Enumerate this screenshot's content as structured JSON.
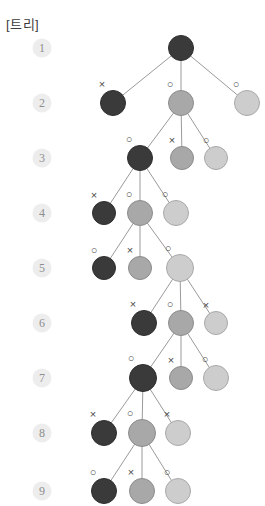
{
  "title": "[트리]",
  "colors": {
    "dark": "#3a3a3a",
    "medium": "#a8a8a8",
    "light": "#cdcdcd",
    "edge": "#9a9a9a",
    "badge_bg": "#ededed",
    "badge_text": "#8e8e8e",
    "mark_text": "#4a4a4a",
    "background": "#ffffff"
  },
  "levels": [
    {
      "label": "1",
      "y": 48,
      "badge_x": 42
    },
    {
      "label": "2",
      "y": 103,
      "badge_x": 42
    },
    {
      "label": "3",
      "y": 158,
      "badge_x": 42
    },
    {
      "label": "4",
      "y": 213,
      "badge_x": 42
    },
    {
      "label": "5",
      "y": 268,
      "badge_x": 42
    },
    {
      "label": "6",
      "y": 323,
      "badge_x": 42
    },
    {
      "label": "7",
      "y": 378,
      "badge_x": 42
    },
    {
      "label": "8",
      "y": 433,
      "badge_x": 42
    },
    {
      "label": "9",
      "y": 491,
      "badge_x": 42
    }
  ],
  "nodes": [
    {
      "id": "n1",
      "level": 1,
      "x": 181,
      "y": 48,
      "r": 13,
      "shade": "dark",
      "mark": "",
      "active": true
    },
    {
      "id": "n2a",
      "level": 2,
      "x": 113,
      "y": 103,
      "r": 13,
      "shade": "dark",
      "mark": "×",
      "active": false
    },
    {
      "id": "n2b",
      "level": 2,
      "x": 181,
      "y": 103,
      "r": 13,
      "shade": "med",
      "mark": "○",
      "active": true
    },
    {
      "id": "n2c",
      "level": 2,
      "x": 247,
      "y": 103,
      "r": 13,
      "shade": "light",
      "mark": "○",
      "active": false
    },
    {
      "id": "n3a",
      "level": 3,
      "x": 140,
      "y": 158,
      "r": 13,
      "shade": "dark",
      "mark": "○",
      "active": true
    },
    {
      "id": "n3b",
      "level": 3,
      "x": 182,
      "y": 158,
      "r": 12,
      "shade": "med",
      "mark": "×",
      "active": false
    },
    {
      "id": "n3c",
      "level": 3,
      "x": 216,
      "y": 158,
      "r": 12,
      "shade": "light",
      "mark": "○",
      "active": false
    },
    {
      "id": "n4a",
      "level": 4,
      "x": 104,
      "y": 213,
      "r": 12,
      "shade": "dark",
      "mark": "×",
      "active": false
    },
    {
      "id": "n4b",
      "level": 4,
      "x": 140,
      "y": 213,
      "r": 13,
      "shade": "med",
      "mark": "○",
      "active": true
    },
    {
      "id": "n4c",
      "level": 4,
      "x": 176,
      "y": 213,
      "r": 13,
      "shade": "light",
      "mark": "○",
      "active": false
    },
    {
      "id": "n5a",
      "level": 5,
      "x": 104,
      "y": 268,
      "r": 12,
      "shade": "dark",
      "mark": "○",
      "active": false
    },
    {
      "id": "n5b",
      "level": 5,
      "x": 140,
      "y": 268,
      "r": 12,
      "shade": "med",
      "mark": "×",
      "active": false
    },
    {
      "id": "n5c",
      "level": 5,
      "x": 180,
      "y": 268,
      "r": 14,
      "shade": "light",
      "mark": "○",
      "active": true
    },
    {
      "id": "n6a",
      "level": 6,
      "x": 144,
      "y": 323,
      "r": 13,
      "shade": "dark",
      "mark": "×",
      "active": false
    },
    {
      "id": "n6b",
      "level": 6,
      "x": 181,
      "y": 323,
      "r": 13,
      "shade": "med",
      "mark": "○",
      "active": true
    },
    {
      "id": "n6c",
      "level": 6,
      "x": 216,
      "y": 323,
      "r": 12,
      "shade": "light",
      "mark": "×",
      "active": false
    },
    {
      "id": "n7a",
      "level": 7,
      "x": 143,
      "y": 378,
      "r": 14,
      "shade": "dark",
      "mark": "○",
      "active": true
    },
    {
      "id": "n7b",
      "level": 7,
      "x": 181,
      "y": 378,
      "r": 12,
      "shade": "med",
      "mark": "×",
      "active": false
    },
    {
      "id": "n7c",
      "level": 7,
      "x": 216,
      "y": 378,
      "r": 13,
      "shade": "light",
      "mark": "○",
      "active": false
    },
    {
      "id": "n8a",
      "level": 8,
      "x": 104,
      "y": 433,
      "r": 13,
      "shade": "dark",
      "mark": "×",
      "active": false
    },
    {
      "id": "n8b",
      "level": 8,
      "x": 142,
      "y": 433,
      "r": 14,
      "shade": "med",
      "mark": "○",
      "active": true
    },
    {
      "id": "n8c",
      "level": 8,
      "x": 178,
      "y": 433,
      "r": 13,
      "shade": "light",
      "mark": "×",
      "active": false
    },
    {
      "id": "n9a",
      "level": 9,
      "x": 104,
      "y": 491,
      "r": 13,
      "shade": "dark",
      "mark": "○",
      "active": false
    },
    {
      "id": "n9b",
      "level": 9,
      "x": 142,
      "y": 491,
      "r": 13,
      "shade": "med",
      "mark": "×",
      "active": false
    },
    {
      "id": "n9c",
      "level": 9,
      "x": 178,
      "y": 491,
      "r": 13,
      "shade": "light",
      "mark": "○",
      "active": false
    }
  ],
  "edges": [
    {
      "from": "n1",
      "to": "n2a"
    },
    {
      "from": "n1",
      "to": "n2b"
    },
    {
      "from": "n1",
      "to": "n2c"
    },
    {
      "from": "n2b",
      "to": "n3a"
    },
    {
      "from": "n2b",
      "to": "n3b"
    },
    {
      "from": "n2b",
      "to": "n3c"
    },
    {
      "from": "n3a",
      "to": "n4a"
    },
    {
      "from": "n3a",
      "to": "n4b"
    },
    {
      "from": "n3a",
      "to": "n4c"
    },
    {
      "from": "n4b",
      "to": "n5a"
    },
    {
      "from": "n4b",
      "to": "n5b"
    },
    {
      "from": "n4b",
      "to": "n5c"
    },
    {
      "from": "n5c",
      "to": "n6a"
    },
    {
      "from": "n5c",
      "to": "n6b"
    },
    {
      "from": "n5c",
      "to": "n6c"
    },
    {
      "from": "n6b",
      "to": "n7a"
    },
    {
      "from": "n6b",
      "to": "n7b"
    },
    {
      "from": "n6b",
      "to": "n7c"
    },
    {
      "from": "n7a",
      "to": "n8a"
    },
    {
      "from": "n7a",
      "to": "n8b"
    },
    {
      "from": "n7a",
      "to": "n8c"
    },
    {
      "from": "n8b",
      "to": "n9a"
    },
    {
      "from": "n8b",
      "to": "n9b"
    },
    {
      "from": "n8b",
      "to": "n9c"
    }
  ],
  "chart_data": {
    "type": "diagram",
    "title": "[트리]",
    "level_labels": [
      "1",
      "2",
      "3",
      "4",
      "5",
      "6",
      "7",
      "8",
      "9"
    ],
    "node_shades": [
      "dark",
      "medium",
      "light"
    ],
    "marks_by_level": [
      [
        "",
        "",
        ""
      ],
      [
        "×",
        "○",
        "○"
      ],
      [
        "○",
        "×",
        "○"
      ],
      [
        "×",
        "○",
        "○"
      ],
      [
        "○",
        "×",
        "○"
      ],
      [
        "×",
        "○",
        "×"
      ],
      [
        "○",
        "×",
        "○"
      ],
      [
        "×",
        "○",
        "×"
      ],
      [
        "○",
        "×",
        "○"
      ]
    ],
    "expanded_child_index_by_level": [
      1,
      0,
      1,
      2,
      1,
      0,
      1,
      null
    ]
  }
}
